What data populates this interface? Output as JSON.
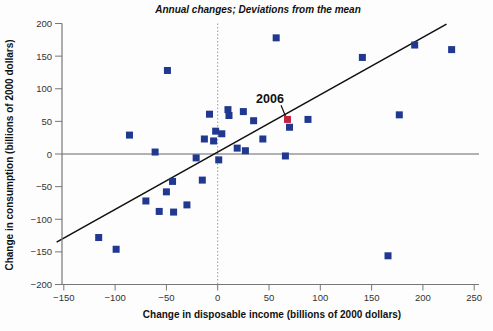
{
  "page": {
    "background": "#fdfdfd"
  },
  "chart_data": {
    "type": "scatter",
    "title": "Annual changes; Deviations from the mean",
    "xlabel": "Change in disposable income (billions of 2000 dollars)",
    "ylabel": "Change in consumption (billions of 2000 dollars)",
    "xlim": [
      -150,
      250
    ],
    "ylim": [
      -200,
      200
    ],
    "x_ticks": {
      "values": [
        -150,
        -100,
        -50,
        0,
        50,
        100,
        150,
        200,
        250
      ],
      "labels": [
        "−150",
        "−100",
        "−50",
        "0",
        "50",
        "100",
        "150",
        "200",
        "250"
      ]
    },
    "y_ticks": {
      "values": [
        -200,
        -150,
        -100,
        -50,
        0,
        50,
        100,
        150,
        200
      ],
      "labels": [
        "−200",
        "−150",
        "−100",
        "−50",
        "0",
        "50",
        "100",
        "150",
        "200"
      ]
    },
    "grid": false,
    "legend": "none",
    "reference_lines": {
      "vertical_x": 0,
      "horizontal_y": 0
    },
    "series": [
      {
        "name": "annual changes (deviations from mean)",
        "marker": "square",
        "color": "#20388f",
        "points": [
          [
            -116,
            -128
          ],
          [
            -99,
            -146
          ],
          [
            -86,
            29
          ],
          [
            -70,
            -72
          ],
          [
            -61,
            3
          ],
          [
            -57,
            -88
          ],
          [
            -50,
            -58
          ],
          [
            -49,
            128
          ],
          [
            -44,
            -42
          ],
          [
            -43,
            -89
          ],
          [
            -30,
            -78
          ],
          [
            -21,
            -6
          ],
          [
            -15,
            -40
          ],
          [
            -13,
            23
          ],
          [
            -8,
            61
          ],
          [
            -4,
            20
          ],
          [
            -2,
            35
          ],
          [
            1,
            -9
          ],
          [
            4,
            31
          ],
          [
            10,
            68
          ],
          [
            11,
            59
          ],
          [
            19,
            9
          ],
          [
            25,
            65
          ],
          [
            27,
            5
          ],
          [
            35,
            51
          ],
          [
            44,
            23
          ],
          [
            57,
            178
          ],
          [
            66,
            -3
          ],
          [
            70,
            41
          ],
          [
            88,
            53
          ],
          [
            141,
            148
          ],
          [
            166,
            -156
          ],
          [
            177,
            60
          ],
          [
            192,
            167
          ],
          [
            228,
            160
          ]
        ]
      },
      {
        "name": "2006 observation",
        "marker": "square",
        "color": "#c22440",
        "points": [
          [
            68,
            53
          ]
        ]
      }
    ],
    "trend_line": {
      "x1": -157,
      "y1": -135,
      "x2": 223,
      "y2": 199,
      "color": "#111111"
    },
    "annotation": {
      "label": "2006",
      "target": {
        "x": 68,
        "y": 53
      },
      "label_pos": {
        "x": 51,
        "y": 84
      }
    }
  },
  "colors": {
    "marker_blue": "#20388f",
    "marker_red": "#c22440",
    "axis": "#777777",
    "ref_vertical": "#999999",
    "ref_horizontal": "#666666",
    "trend": "#111111",
    "tick_text": "#333333"
  }
}
